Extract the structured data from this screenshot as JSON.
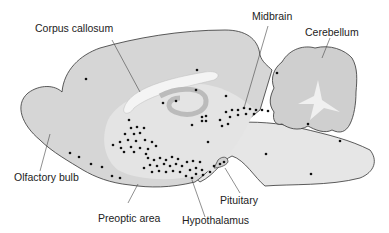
{
  "diagram": {
    "labels": {
      "corpus_callosum": "Corpus callosum",
      "midbrain": "Midbrain",
      "cerebellum": "Cerebellum",
      "olfactory_bulb": "Olfactory bulb",
      "preoptic_area": "Preoptic area",
      "hypothalamus": "Hypothalamus",
      "pituitary": "Pituitary"
    },
    "colors": {
      "cortex_fill": "#d4d4d4",
      "brainstem_fill": "#e6e6e6",
      "white_matter": "#f0f0f0",
      "outline": "#333333",
      "dot": "#111111"
    }
  }
}
